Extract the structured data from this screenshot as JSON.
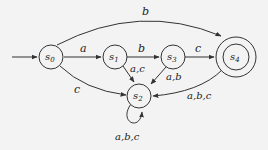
{
  "diagram": {
    "type": "finite-automaton",
    "background": "#f3f3f3",
    "line_color": "#333333",
    "start_state": "s0",
    "accepting_states": [
      "s4"
    ],
    "states": [
      {
        "id": "s0",
        "label_base": "s",
        "label_sub": "0"
      },
      {
        "id": "s1",
        "label_base": "s",
        "label_sub": "1"
      },
      {
        "id": "s2",
        "label_base": "s",
        "label_sub": "2"
      },
      {
        "id": "s3",
        "label_base": "s",
        "label_sub": "3"
      },
      {
        "id": "s4",
        "label_base": "s",
        "label_sub": "4"
      }
    ],
    "transitions": [
      {
        "from": "s0",
        "to": "s1",
        "label": "a"
      },
      {
        "from": "s1",
        "to": "s3",
        "label": "b"
      },
      {
        "from": "s3",
        "to": "s4",
        "label": "c"
      },
      {
        "from": "s0",
        "to": "s4",
        "label": "b"
      },
      {
        "from": "s0",
        "to": "s2",
        "label": "c"
      },
      {
        "from": "s1",
        "to": "s2",
        "label": "a,c"
      },
      {
        "from": "s3",
        "to": "s2",
        "label": "a,b"
      },
      {
        "from": "s4",
        "to": "s2",
        "label": "a,b,c"
      },
      {
        "from": "s2",
        "to": "s2",
        "label": "a,b,c"
      }
    ]
  }
}
